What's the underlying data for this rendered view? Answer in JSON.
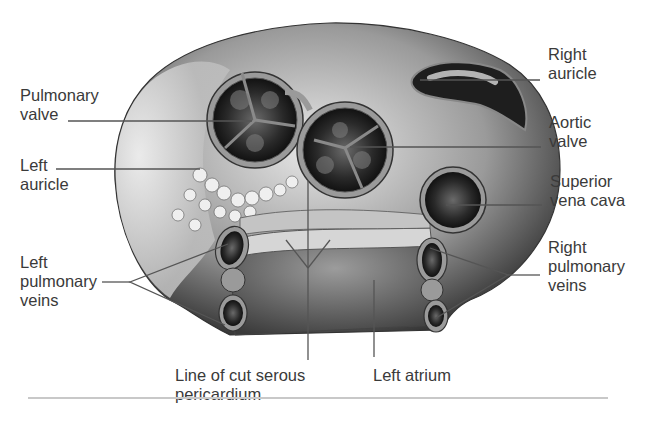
{
  "figure": {
    "labels": [
      {
        "id": "pulmonary_valve",
        "text": "Pulmonary\nvalve",
        "x": 20,
        "y": 86
      },
      {
        "id": "left_auricle",
        "text": "Left\nauricle",
        "x": 20,
        "y": 156
      },
      {
        "id": "left_pulmonary_veins",
        "text": "Left\npulmonary\nveins",
        "x": 20,
        "y": 253
      },
      {
        "id": "right_auricle",
        "text": "Right\nauricle",
        "x": 548,
        "y": 45
      },
      {
        "id": "aortic_valve",
        "text": "Aortic\nvalve",
        "x": 549,
        "y": 113
      },
      {
        "id": "superior_vena_cava",
        "text": "Superior\nvena cava",
        "x": 550,
        "y": 172
      },
      {
        "id": "right_pulmonary_veins",
        "text": "Right\npulmonary\nveins",
        "x": 548,
        "y": 238
      },
      {
        "id": "line_of_cut_serous_pericardium",
        "text": "Line of cut serous\npericardium",
        "x": 175,
        "y": 366
      },
      {
        "id": "left_atrium",
        "text": "Left atrium",
        "x": 373,
        "y": 366
      }
    ],
    "colors": {
      "label_text": "#3a3a3a",
      "leader_line": "#555555",
      "rule": "#c8c8c8"
    }
  }
}
